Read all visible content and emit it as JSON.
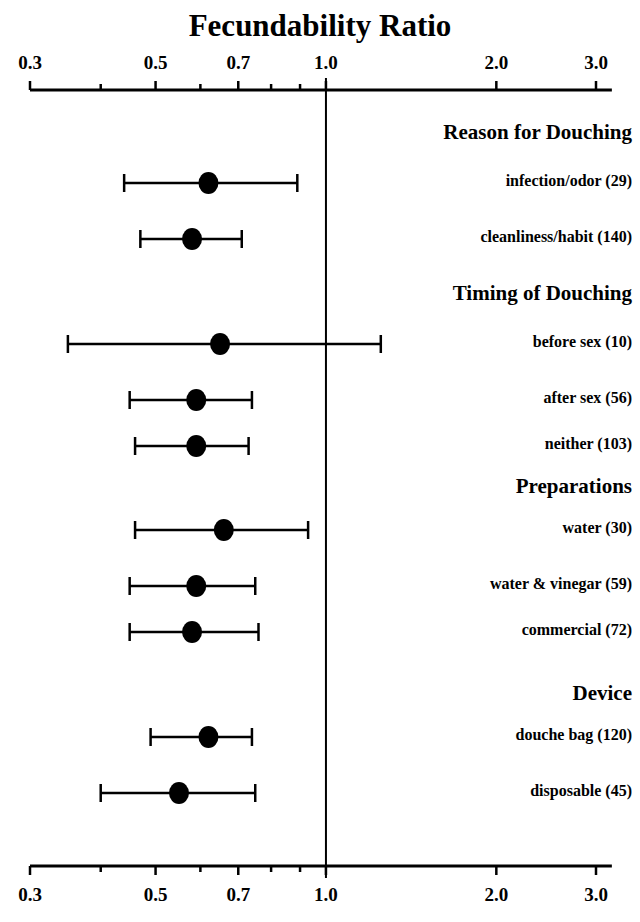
{
  "chart_data": {
    "type": "scatter",
    "title": "Fecundability Ratio",
    "xlabel": "Fecundability Ratio",
    "ylabel": "",
    "scale": "log",
    "xlim": [
      0.3,
      3.2
    ],
    "grid": false,
    "legend": null,
    "reference_line": 1.0,
    "tick_labels": [
      "0.3",
      "0.5",
      "0.7",
      "1.0",
      "2.0",
      "3.0"
    ],
    "tick_values": [
      0.3,
      0.5,
      0.7,
      1.0,
      2.0,
      3.0
    ],
    "minor_tick_values": [
      0.4,
      0.6,
      0.8,
      0.9
    ],
    "axis_positions": [
      "top",
      "bottom"
    ],
    "point_estimate_marker": "filled-circle",
    "interval_label": "95% confidence interval",
    "groups": [
      {
        "heading": "Reason for Douching",
        "rows": [
          {
            "label": "infection/odor (29)",
            "n": 29,
            "estimate": 0.62,
            "ci_low": 0.44,
            "ci_high": 0.89
          },
          {
            "label": "cleanliness/habit (140)",
            "n": 140,
            "estimate": 0.58,
            "ci_low": 0.47,
            "ci_high": 0.71
          }
        ]
      },
      {
        "heading": "Timing of Douching",
        "rows": [
          {
            "label": "before sex (10)",
            "n": 10,
            "estimate": 0.65,
            "ci_low": 0.35,
            "ci_high": 1.25
          },
          {
            "label": "after sex (56)",
            "n": 56,
            "estimate": 0.59,
            "ci_low": 0.45,
            "ci_high": 0.74
          },
          {
            "label": "neither (103)",
            "n": 103,
            "estimate": 0.59,
            "ci_low": 0.46,
            "ci_high": 0.73
          }
        ]
      },
      {
        "heading": "Preparations",
        "rows": [
          {
            "label": "water (30)",
            "n": 30,
            "estimate": 0.66,
            "ci_low": 0.46,
            "ci_high": 0.93
          },
          {
            "label": "water & vinegar (59)",
            "n": 59,
            "estimate": 0.59,
            "ci_low": 0.45,
            "ci_high": 0.75
          },
          {
            "label": "commercial (72)",
            "n": 72,
            "estimate": 0.58,
            "ci_low": 0.45,
            "ci_high": 0.76
          }
        ]
      },
      {
        "heading": "Device",
        "rows": [
          {
            "label": "douche bag (120)",
            "n": 120,
            "estimate": 0.62,
            "ci_low": 0.49,
            "ci_high": 0.74
          },
          {
            "label": "disposable (45)",
            "n": 45,
            "estimate": 0.55,
            "ci_low": 0.4,
            "ci_high": 0.75
          }
        ]
      }
    ]
  }
}
